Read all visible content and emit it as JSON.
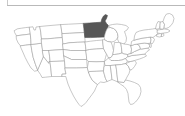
{
  "widget": {
    "name": "us-states-choropleth",
    "background_color": "#ffffff",
    "divider_color": "#b9b9b9"
  },
  "map": {
    "title": "",
    "projection": "albers-usa",
    "base_fill": "#ffffff",
    "base_stroke": "#9a9a9a",
    "selected_fill": "#575757",
    "selected_stroke": "#4a4a4a",
    "selected_states": [
      "MN"
    ],
    "selected_state_names": [
      "Minnesota"
    ],
    "states": [
      {
        "code": "WA",
        "name": "Washington",
        "selected": false
      },
      {
        "code": "OR",
        "name": "Oregon",
        "selected": false
      },
      {
        "code": "CA",
        "name": "California",
        "selected": false
      },
      {
        "code": "NV",
        "name": "Nevada",
        "selected": false
      },
      {
        "code": "ID",
        "name": "Idaho",
        "selected": false
      },
      {
        "code": "MT",
        "name": "Montana",
        "selected": false
      },
      {
        "code": "WY",
        "name": "Wyoming",
        "selected": false
      },
      {
        "code": "UT",
        "name": "Utah",
        "selected": false
      },
      {
        "code": "AZ",
        "name": "Arizona",
        "selected": false
      },
      {
        "code": "CO",
        "name": "Colorado",
        "selected": false
      },
      {
        "code": "NM",
        "name": "New Mexico",
        "selected": false
      },
      {
        "code": "ND",
        "name": "North Dakota",
        "selected": false
      },
      {
        "code": "SD",
        "name": "South Dakota",
        "selected": false
      },
      {
        "code": "NE",
        "name": "Nebraska",
        "selected": false
      },
      {
        "code": "KS",
        "name": "Kansas",
        "selected": false
      },
      {
        "code": "OK",
        "name": "Oklahoma",
        "selected": false
      },
      {
        "code": "TX",
        "name": "Texas",
        "selected": false
      },
      {
        "code": "MN",
        "name": "Minnesota",
        "selected": true
      },
      {
        "code": "IA",
        "name": "Iowa",
        "selected": false
      },
      {
        "code": "MO",
        "name": "Missouri",
        "selected": false
      },
      {
        "code": "AR",
        "name": "Arkansas",
        "selected": false
      },
      {
        "code": "LA",
        "name": "Louisiana",
        "selected": false
      },
      {
        "code": "WI",
        "name": "Wisconsin",
        "selected": false
      },
      {
        "code": "IL",
        "name": "Illinois",
        "selected": false
      },
      {
        "code": "MI",
        "name": "Michigan",
        "selected": false
      },
      {
        "code": "IN",
        "name": "Indiana",
        "selected": false
      },
      {
        "code": "OH",
        "name": "Ohio",
        "selected": false
      },
      {
        "code": "KY",
        "name": "Kentucky",
        "selected": false
      },
      {
        "code": "TN",
        "name": "Tennessee",
        "selected": false
      },
      {
        "code": "MS",
        "name": "Mississippi",
        "selected": false
      },
      {
        "code": "AL",
        "name": "Alabama",
        "selected": false
      },
      {
        "code": "GA",
        "name": "Georgia",
        "selected": false
      },
      {
        "code": "FL",
        "name": "Florida",
        "selected": false
      },
      {
        "code": "SC",
        "name": "South Carolina",
        "selected": false
      },
      {
        "code": "NC",
        "name": "North Carolina",
        "selected": false
      },
      {
        "code": "VA",
        "name": "Virginia",
        "selected": false
      },
      {
        "code": "WV",
        "name": "West Virginia",
        "selected": false
      },
      {
        "code": "MD",
        "name": "Maryland",
        "selected": false
      },
      {
        "code": "DE",
        "name": "Delaware",
        "selected": false
      },
      {
        "code": "PA",
        "name": "Pennsylvania",
        "selected": false
      },
      {
        "code": "NJ",
        "name": "New Jersey",
        "selected": false
      },
      {
        "code": "NY",
        "name": "New York",
        "selected": false
      },
      {
        "code": "CT",
        "name": "Connecticut",
        "selected": false
      },
      {
        "code": "RI",
        "name": "Rhode Island",
        "selected": false
      },
      {
        "code": "MA",
        "name": "Massachusetts",
        "selected": false
      },
      {
        "code": "VT",
        "name": "Vermont",
        "selected": false
      },
      {
        "code": "NH",
        "name": "New Hampshire",
        "selected": false
      },
      {
        "code": "ME",
        "name": "Maine",
        "selected": false
      }
    ]
  }
}
